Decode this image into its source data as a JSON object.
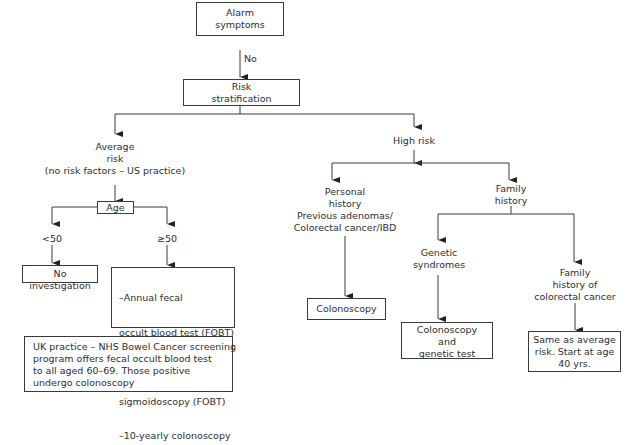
{
  "diagram": {
    "type": "flowchart",
    "nodes": {
      "alarm": {
        "lines": [
          "Alarm",
          "symptoms"
        ]
      },
      "no_label": {
        "text": "No"
      },
      "risk": {
        "lines": [
          "Risk",
          "stratification"
        ]
      },
      "average": {
        "lines": [
          "Average",
          "risk",
          "(no risk factors – US practice)"
        ]
      },
      "age": {
        "text": "Age"
      },
      "lt50": {
        "text": "<50"
      },
      "ge50": {
        "text": "≥50"
      },
      "no_investigation": {
        "text": "No investigation"
      },
      "screening": {
        "lines": [
          "–Annual fecal",
          "  occult blood test (FOBT)",
          "–5-yearly flexible",
          "  sigmoidoscopy (FOBT)",
          "–10-yearly colonoscopy"
        ]
      },
      "uk": {
        "lines": [
          "UK practice – NHS Bowel Cancer screening",
          "program offers fecal occult blood test",
          "to all aged 60–69. Those positive",
          "undergo colonoscopy"
        ]
      },
      "high": {
        "text": "High risk"
      },
      "personal": {
        "lines": [
          "Personal",
          "history",
          "Previous adenomas/",
          "Colorectal cancer/IBD"
        ]
      },
      "colonoscopy": {
        "text": "Colonoscopy"
      },
      "family": {
        "lines": [
          "Family",
          "history"
        ]
      },
      "genetic": {
        "lines": [
          "Genetic",
          "syndromes"
        ]
      },
      "col_genetic": {
        "lines": [
          "Colonoscopy",
          "and",
          "genetic test"
        ]
      },
      "family_crc": {
        "lines": [
          "Family",
          "history of",
          "colorectal cancer"
        ]
      },
      "same_avg": {
        "lines": [
          "Same as average",
          "risk. Start at age",
          "40 yrs."
        ]
      }
    },
    "edges": [
      {
        "from": "alarm",
        "to": "risk",
        "label": "No"
      },
      {
        "from": "risk",
        "to": "average"
      },
      {
        "from": "risk",
        "to": "high"
      },
      {
        "from": "average",
        "to": "age"
      },
      {
        "from": "age",
        "to": "lt50"
      },
      {
        "from": "age",
        "to": "ge50"
      },
      {
        "from": "lt50",
        "to": "no_investigation"
      },
      {
        "from": "ge50",
        "to": "screening"
      },
      {
        "from": "high",
        "to": "personal"
      },
      {
        "from": "high",
        "to": "family"
      },
      {
        "from": "personal",
        "to": "colonoscopy"
      },
      {
        "from": "family",
        "to": "genetic"
      },
      {
        "from": "family",
        "to": "family_crc"
      },
      {
        "from": "genetic",
        "to": "col_genetic"
      },
      {
        "from": "family_crc",
        "to": "same_avg"
      }
    ],
    "colors": {
      "stroke": "#3a3a3a",
      "text": "#2e2e2e",
      "background": "#ffffff"
    }
  }
}
